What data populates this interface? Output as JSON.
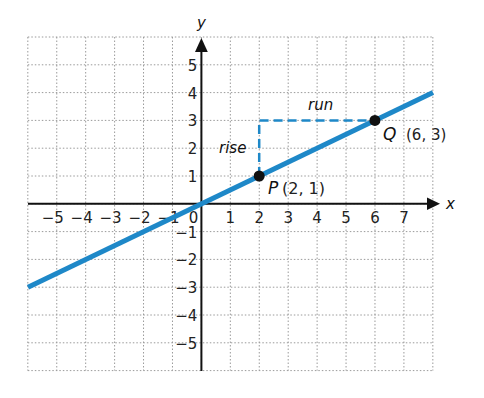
{
  "chart_data": {
    "type": "line",
    "title": "",
    "xlabel": "x",
    "ylabel": "y",
    "xlim": [
      -6,
      8
    ],
    "ylim": [
      -6,
      6
    ],
    "grid": true,
    "x_ticks": [
      "−5",
      "−4",
      "−3",
      "−2",
      "−1",
      "0",
      "1",
      "2",
      "3",
      "4",
      "5",
      "6",
      "7"
    ],
    "y_ticks": [
      "5",
      "4",
      "3",
      "2",
      "1",
      "−1",
      "−2",
      "−3",
      "−4",
      "−5"
    ],
    "series": [
      {
        "name": "line through P and Q",
        "equation": "y = x/2",
        "slope": 0.5,
        "x": [
          -6,
          8
        ],
        "y": [
          -3,
          4
        ],
        "color": "#1e88c8"
      }
    ],
    "points": [
      {
        "name": "P",
        "label": "P",
        "coords": "(2, 1)",
        "x": 2,
        "y": 1
      },
      {
        "name": "Q",
        "label": "Q",
        "coords": "(6, 3)",
        "x": 6,
        "y": 3
      }
    ],
    "annotations": {
      "rise": "rise",
      "run": "run"
    }
  },
  "labels": {
    "x_axis": "x",
    "y_axis": "y",
    "rise": "rise",
    "run": "run",
    "p_letter": "P",
    "p_coords": "(2, 1)",
    "q_letter": "Q",
    "q_coords": "(6, 3)",
    "origin": "0"
  },
  "colors": {
    "line": "#1e88c8",
    "axis": "#111111",
    "grid": "#9a9a9a"
  }
}
